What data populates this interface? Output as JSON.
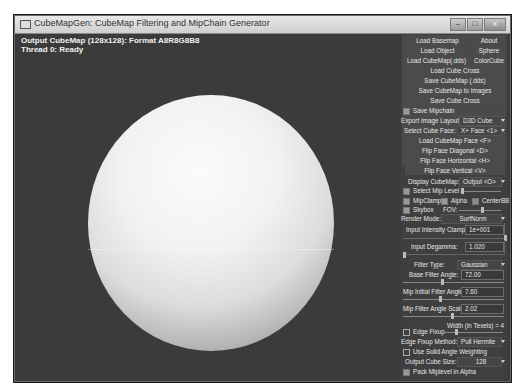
{
  "window": {
    "title": "CubeMapGen: CubeMap Filtering and MipChain Generator",
    "controls": {
      "minimize": "–",
      "maximize": "□",
      "close": "x"
    }
  },
  "viewport": {
    "status_line1": "Output CubeMap (128x128): Format A8R8G8B8",
    "status_line2": "Thread 0: Ready",
    "preview_object": "sphere"
  },
  "panel": {
    "buttons": {
      "load_basemap": "Load Basemap",
      "about": "About",
      "load_object": "Load Object",
      "sphere": "Sphere",
      "load_cubemap_dds": "Load CubeMap(.dds)",
      "color_cube": "ColorCube",
      "load_cube_cross": "Load Cube Cross",
      "save_cubemap_dds": "Save CubeMap (.dds)",
      "save_cubemap_images": "Save CubeMap to Images",
      "save_cube_cross": "Save Cube Cross",
      "load_cubemap_face": "Load CubeMap Face  <F>",
      "flip_diagonal": "Flip Face Diagonal  <D>",
      "flip_horizontal": "Flip Face Horizontal  <H>",
      "flip_vertical": "Flip Face Vertical  <V>"
    },
    "save_mipchain": {
      "label": "Save Mipchain",
      "checked": false
    },
    "export_image_layout": {
      "label": "Export Image Layout:",
      "value": "D3D Cube"
    },
    "select_cube_face": {
      "label": "Select Cube Face:",
      "value": "X+ Face <1>"
    },
    "display_cubemap": {
      "label": "Display CubeMap:",
      "value": "Output <O>"
    },
    "select_mip_level": {
      "label": "Select Mip Level",
      "checked": false
    },
    "mipclamp": {
      "label": "MipClamp",
      "checked": false
    },
    "alpha": {
      "label": "Alpha",
      "checked": false
    },
    "centerbb": {
      "label": "CenterBB",
      "checked": true
    },
    "skybox": {
      "label": "Skybox",
      "checked": false
    },
    "fov_label": "FOV:",
    "render_mode": {
      "label": "Render Mode:",
      "value": "SurfNorm"
    },
    "input_intensity_clamp": {
      "label": "Input Intensity Clamp:",
      "value": "1e+001"
    },
    "input_degamma": {
      "label": "Input Degamma:",
      "value": "1.020"
    },
    "filter_type": {
      "label": "Filter Type:",
      "value": "Gaussian"
    },
    "base_filter_angle": {
      "label": "Base Filter Angle:",
      "value": "72.00"
    },
    "mip_initial_filter_angle": {
      "label": "Mip Initial Filter Angle:",
      "value": "7.60"
    },
    "mip_filter_angle_scale": {
      "label": "Mip Filter Angle Scale:",
      "value": "2.02"
    },
    "edge_fixup": {
      "label": "Edge Fixup",
      "checked": true,
      "width_label": "Width (in Texels) = 4"
    },
    "edge_fixup_method": {
      "label": "Edge Fixup Method:",
      "value": "Pull Hermite"
    },
    "use_solid_angle": {
      "label": "Use Solid Angle Weighting",
      "checked": true
    },
    "output_cube_size": {
      "label": "Output Cube Size:",
      "value": "128"
    },
    "pack_mip_alpha": {
      "label": "Pack Miplevel in Alpha",
      "checked": false
    }
  }
}
